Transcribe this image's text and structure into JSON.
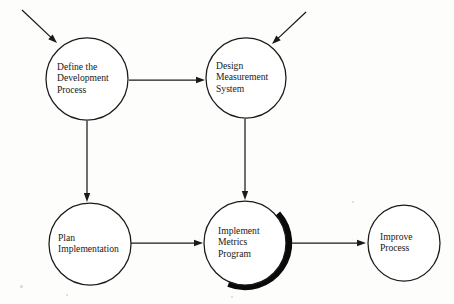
{
  "diagram": {
    "background_color": "#fdfdfb",
    "line_color": "#1a1a1a",
    "shadow_color": "#0a0a0a",
    "nodes": [
      {
        "id": "define-development-process",
        "name": "Define the Development Process",
        "lines": [
          "Define the",
          "Development",
          "Process"
        ],
        "cx": 87,
        "cy": 79,
        "rx": 41,
        "ry": 41,
        "text_x": 57,
        "highlighted": false
      },
      {
        "id": "design-measurement-system",
        "name": "Design Measurement System",
        "lines": [
          "Design",
          "Measurement",
          "System"
        ],
        "cx": 246,
        "cy": 78,
        "rx": 40,
        "ry": 40,
        "text_x": 216,
        "highlighted": false
      },
      {
        "id": "plan-implementation",
        "name": "Plan Implementation",
        "lines": [
          "Plan",
          "Implementation"
        ],
        "cx": 90,
        "cy": 244,
        "rx": 41,
        "ry": 41,
        "text_x": 58,
        "highlighted": false
      },
      {
        "id": "implement-metrics-program",
        "name": "Implement Metrics Program",
        "lines": [
          "Implement",
          "Metrics",
          "Program"
        ],
        "cx": 245,
        "cy": 243,
        "rx": 41,
        "ry": 42,
        "text_x": 218,
        "highlighted": true
      },
      {
        "id": "improve-process",
        "name": "Improve Process",
        "lines": [
          "Improve",
          "Process"
        ],
        "cx": 404,
        "cy": 243,
        "rx": 36,
        "ry": 38,
        "text_x": 380,
        "highlighted": false
      }
    ],
    "connectors": [
      {
        "id": "external-input-to-define",
        "label": "external input into Define the Development Process",
        "kind": "diagonal",
        "x1": 22,
        "y1": 10,
        "x2": 57,
        "y2": 43,
        "head_angle": 43
      },
      {
        "id": "external-input-to-design",
        "label": "external input into Design Measurement System",
        "kind": "diagonal",
        "x1": 306,
        "y1": 12,
        "x2": 272,
        "y2": 44,
        "head_angle": 137
      },
      {
        "id": "define-to-design",
        "label": "Define the Development Process to Design Measurement System",
        "kind": "horizontal",
        "x1": 129,
        "y1": 80,
        "x2": 205,
        "y2": 80,
        "head_angle": 0
      },
      {
        "id": "define-to-plan",
        "label": "Define the Development Process to Plan Implementation",
        "kind": "vertical",
        "x1": 87,
        "y1": 121,
        "x2": 87,
        "y2": 202,
        "head_angle": 90
      },
      {
        "id": "design-to-implement",
        "label": "Design Measurement System to Implement Metrics Program",
        "kind": "vertical",
        "x1": 245,
        "y1": 119,
        "x2": 245,
        "y2": 200,
        "head_angle": 90
      },
      {
        "id": "plan-to-implement",
        "label": "Plan Implementation to Implement Metrics Program",
        "kind": "horizontal",
        "x1": 131,
        "y1": 243,
        "x2": 203,
        "y2": 243,
        "head_angle": 0
      },
      {
        "id": "implement-to-improve",
        "label": "Implement Metrics Program to Improve Process",
        "kind": "horizontal",
        "x1": 290,
        "y1": 243,
        "x2": 366,
        "y2": 243,
        "head_angle": 0
      }
    ],
    "specks": [
      {
        "x": 20,
        "y": 285,
        "size": 3
      },
      {
        "x": 66,
        "y": 294,
        "size": 2
      },
      {
        "x": 231,
        "y": 296,
        "size": 2
      },
      {
        "x": 352,
        "y": 201,
        "size": 2
      }
    ]
  }
}
